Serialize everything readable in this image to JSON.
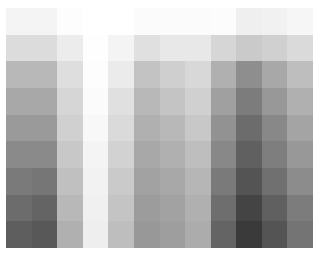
{
  "chart_data": {
    "type": "heatmap",
    "title": "",
    "xlabel": "",
    "ylabel": "",
    "rows": 9,
    "cols": 12,
    "legend": "none",
    "grid": false,
    "colormap": "grayscale (higher value = darker)",
    "values": [
      [
        4,
        4,
        1,
        0,
        0,
        2,
        2,
        2,
        1,
        6,
        5,
        4
      ],
      [
        14,
        14,
        7,
        0,
        4,
        12,
        9,
        9,
        16,
        21,
        18,
        15
      ],
      [
        28,
        28,
        13,
        1,
        8,
        24,
        19,
        15,
        31,
        44,
        34,
        25
      ],
      [
        34,
        34,
        16,
        2,
        12,
        28,
        23,
        18,
        37,
        51,
        40,
        31
      ],
      [
        40,
        40,
        18,
        3,
        15,
        31,
        28,
        22,
        43,
        58,
        47,
        36
      ],
      [
        46,
        46,
        22,
        4,
        18,
        34,
        31,
        25,
        47,
        62,
        51,
        40
      ],
      [
        52,
        54,
        25,
        5,
        21,
        36,
        34,
        29,
        52,
        67,
        56,
        45
      ],
      [
        58,
        61,
        28,
        6,
        23,
        39,
        36,
        31,
        57,
        73,
        62,
        51
      ],
      [
        63,
        65,
        31,
        7,
        25,
        40,
        38,
        33,
        61,
        77,
        67,
        55
      ]
    ],
    "cell_colors": [
      [
        "#f4f4f4",
        "#f4f4f4",
        "#fdfdfd",
        "#ffffff",
        "#ffffff",
        "#fbfbfb",
        "#fbfbfb",
        "#fbfbfb",
        "#fcfcfc",
        "#efefef",
        "#f1f1f1",
        "#f6f6f6"
      ],
      [
        "#dcdcdc",
        "#dcdcdc",
        "#ececec",
        "#fefefe",
        "#f4f4f4",
        "#e0e0e0",
        "#e8e8e8",
        "#e8e8e8",
        "#d6d6d6",
        "#cacaca",
        "#d0d0d0",
        "#dadada"
      ],
      [
        "#b8b8b8",
        "#b8b8b8",
        "#dedede",
        "#fdfdfd",
        "#ebebeb",
        "#c3c3c3",
        "#cfcfcf",
        "#d8d8d8",
        "#b0b0b0",
        "#8e8e8e",
        "#a8a8a8",
        "#bebebe"
      ],
      [
        "#a8a8a8",
        "#a8a8a8",
        "#d6d6d6",
        "#fbfbfb",
        "#e0e0e0",
        "#b8b8b8",
        "#c4c4c4",
        "#d0d0d0",
        "#a0a0a0",
        "#7c7c7c",
        "#989898",
        "#b0b0b0"
      ],
      [
        "#9a9a9a",
        "#9a9a9a",
        "#d0d0d0",
        "#f8f8f8",
        "#dadada",
        "#b0b0b0",
        "#b8b8b8",
        "#c8c8c8",
        "#929292",
        "#6c6c6c",
        "#888888",
        "#a4a4a4"
      ],
      [
        "#8a8a8a",
        "#8a8a8a",
        "#c8c8c8",
        "#f4f4f4",
        "#d2d2d2",
        "#a8a8a8",
        "#b0b0b0",
        "#bebebe",
        "#888888",
        "#606060",
        "#7e7e7e",
        "#989898"
      ],
      [
        "#7a7a7a",
        "#767676",
        "#c0c0c0",
        "#f2f2f2",
        "#cacaca",
        "#a2a2a2",
        "#a8a8a8",
        "#b6b6b6",
        "#7a7a7a",
        "#545454",
        "#707070",
        "#8c8c8c"
      ],
      [
        "#6c6c6c",
        "#646464",
        "#b8b8b8",
        "#f0f0f0",
        "#c4c4c4",
        "#9c9c9c",
        "#a2a2a2",
        "#b0b0b0",
        "#6e6e6e",
        "#444444",
        "#606060",
        "#7c7c7c"
      ],
      [
        "#5e5e5e",
        "#585858",
        "#b0b0b0",
        "#eeeeee",
        "#bebebe",
        "#989898",
        "#9e9e9e",
        "#acacac",
        "#646464",
        "#3a3a3a",
        "#545454",
        "#747474"
      ]
    ]
  }
}
